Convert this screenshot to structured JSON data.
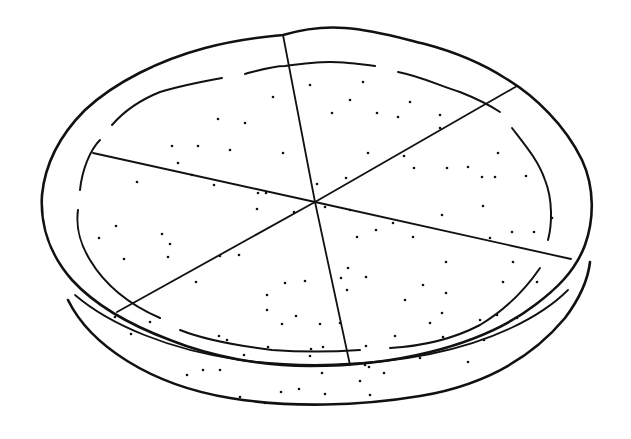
{
  "illustration": {
    "subject": "pie cut into six slices",
    "style": "black line drawing on white",
    "slice_count": 6,
    "colors": {
      "background": "#ffffff",
      "ink": "#111111"
    }
  }
}
